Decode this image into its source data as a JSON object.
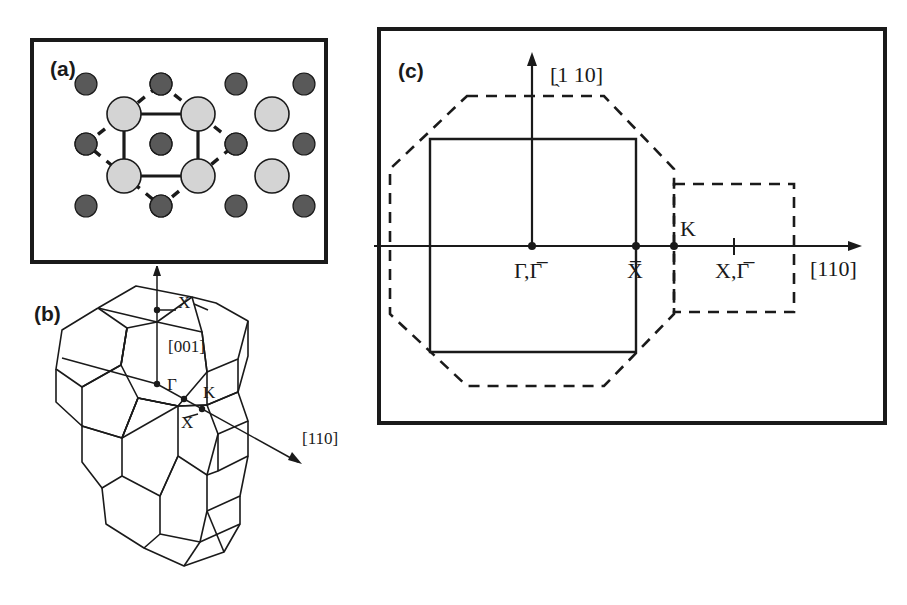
{
  "figure": {
    "background": "#ffffff",
    "ink": "#1a1a1a",
    "width": 907,
    "height": 605
  },
  "panel_a": {
    "tag": "(a)",
    "description": "surface atomic structure top view",
    "colors": {
      "substrate_atom": "#595959",
      "adatom": "#d4d4d4",
      "outline": "#1a1a1a"
    },
    "atoms": {
      "dark_label": "substrate-atom",
      "light_label": "adatom",
      "dark_radius": 11,
      "light_radius": 17,
      "dark_positions": [
        [
          60,
          50
        ],
        [
          135,
          50
        ],
        [
          210,
          50
        ],
        [
          278,
          50
        ],
        [
          60,
          110
        ],
        [
          135,
          110
        ],
        [
          210,
          110
        ],
        [
          278,
          110
        ],
        [
          60,
          172
        ],
        [
          135,
          172
        ],
        [
          210,
          172
        ],
        [
          278,
          172
        ]
      ],
      "light_positions": [
        [
          98,
          80
        ],
        [
          172,
          80
        ],
        [
          246,
          80
        ],
        [
          98,
          142
        ],
        [
          172,
          142
        ],
        [
          246,
          142
        ]
      ]
    },
    "solid_square": [
      [
        98,
        80
      ],
      [
        172,
        80
      ],
      [
        172,
        142
      ],
      [
        98,
        142
      ]
    ],
    "dashed_diamond": [
      [
        135,
        50
      ],
      [
        210,
        110
      ],
      [
        135,
        172
      ],
      [
        60,
        110
      ]
    ]
  },
  "panel_b": {
    "tag": "(b)",
    "description": "bulk Brillouin zone, two fused truncated octahedra",
    "labels": {
      "x_top": "X",
      "direction_001": "[001]",
      "gamma": "Γ",
      "k_point": "K",
      "x_mid": "X",
      "direction_110": "[110]"
    }
  },
  "panel_c": {
    "tag": "(c)",
    "description": "surface Brillouin zone projection",
    "labels": {
      "axis_vertical": "[̖1 10]",
      "axis_vertical_plain": "[1 10]",
      "axis_horizontal": "[110]",
      "origin": "Γ,Γ̅",
      "x_bar": "X̅",
      "k_point": "K",
      "x_gamma_bar": "X,Γ̅"
    },
    "legend": {
      "solid": "surface Brillouin zone (solid square)",
      "dashed": "bulk Brillouin zone projection (dashed octagon and square)"
    }
  }
}
